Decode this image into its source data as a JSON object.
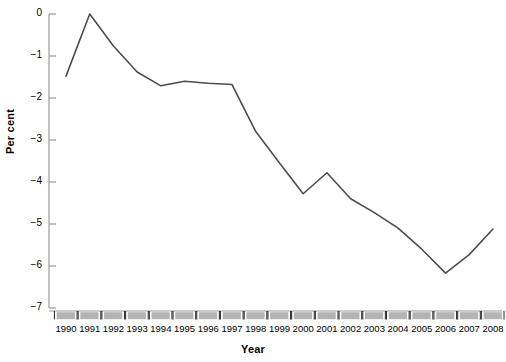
{
  "chart_data": {
    "type": "line",
    "title": "",
    "xlabel": "Year",
    "ylabel": "Per cent",
    "categories": [
      "1990",
      "1991",
      "1992",
      "1993",
      "1994",
      "1995",
      "1996",
      "1997",
      "1998",
      "1999",
      "2000",
      "2001",
      "2002",
      "2003",
      "2004",
      "2005",
      "2006",
      "2007",
      "2008"
    ],
    "x": [
      1990,
      1991,
      1992,
      1993,
      1994,
      1995,
      1996,
      1997,
      1998,
      1999,
      2000,
      2001,
      2002,
      2003,
      2004,
      2005,
      2006,
      2007,
      2008
    ],
    "values": [
      -1.48,
      0.0,
      -0.76,
      -1.38,
      -1.71,
      -1.6,
      -1.65,
      -1.68,
      -2.8,
      -3.55,
      -4.28,
      -3.78,
      -4.4,
      -4.73,
      -5.1,
      -5.6,
      -6.17,
      -5.73,
      -5.12
    ],
    "series": [
      {
        "name": "Per cent",
        "values": [
          -1.48,
          0.0,
          -0.76,
          -1.38,
          -1.71,
          -1.6,
          -1.65,
          -1.68,
          -2.8,
          -3.55,
          -4.28,
          -3.78,
          -4.4,
          -4.73,
          -5.1,
          -5.6,
          -6.17,
          -5.73,
          -5.12
        ]
      }
    ],
    "ylim": [
      -7,
      0
    ],
    "xlim": [
      1990,
      2008
    ],
    "yticks": [
      0,
      -1,
      -2,
      -3,
      -4,
      -5,
      -6,
      -7
    ],
    "ytick_labels": [
      "0",
      "−1",
      "−2",
      "−3",
      "−4",
      "−5",
      "−6",
      "−7"
    ],
    "grid": false,
    "legend": "none",
    "line_color": "#4d4d4d",
    "axis_color": "#9a9a9a",
    "tick_block_color": "#b3b3b3"
  },
  "axes": {
    "y_title": "Per cent",
    "x_title": "Year"
  }
}
